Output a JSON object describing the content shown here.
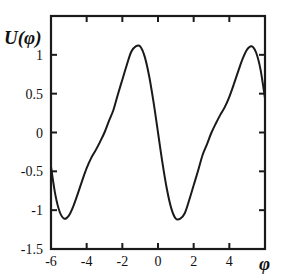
{
  "chart_data": {
    "type": "line",
    "title": "",
    "xlabel": "φ",
    "ylabel": "U(φ)",
    "xlim": [
      -6,
      6
    ],
    "ylim": [
      -1.5,
      1.5
    ],
    "grid": false,
    "legend": null,
    "x_ticks": [
      -6,
      -4,
      -2,
      0,
      2,
      4
    ],
    "x_tick_labels": [
      "-6",
      "-4",
      "-2",
      "0",
      "2",
      "4"
    ],
    "y_ticks": [
      -1.5,
      -1,
      -0.5,
      0,
      0.5,
      1
    ],
    "y_tick_labels": [
      "-1.5",
      "-1",
      "-0.5",
      "0",
      "0.5",
      "1"
    ],
    "series": [
      {
        "name": "U(φ)",
        "color": "#1a1a1a",
        "x": [
          -6.0,
          -5.75,
          -5.5,
          -5.25,
          -5.0,
          -4.75,
          -4.5,
          -4.25,
          -4.0,
          -3.75,
          -3.5,
          -3.25,
          -3.0,
          -2.75,
          -2.5,
          -2.25,
          -2.0,
          -1.75,
          -1.5,
          -1.25,
          -1.0,
          -0.75,
          -0.5,
          -0.25,
          0.0,
          0.25,
          0.5,
          0.75,
          1.0,
          1.25,
          1.5,
          1.75,
          2.0,
          2.25,
          2.5,
          2.75,
          3.0,
          3.25,
          3.5,
          3.75,
          4.0,
          4.25,
          4.5,
          4.75,
          5.0,
          5.25,
          5.5,
          5.75,
          6.0
        ],
        "y": [
          -0.44,
          -0.81,
          -1.03,
          -1.11,
          -1.07,
          -0.95,
          -0.79,
          -0.62,
          -0.46,
          -0.33,
          -0.23,
          -0.12,
          0.0,
          0.15,
          0.29,
          0.49,
          0.68,
          0.87,
          1.04,
          1.11,
          1.11,
          0.98,
          0.73,
          0.39,
          0.0,
          -0.39,
          -0.73,
          -0.98,
          -1.11,
          -1.11,
          -1.04,
          -0.87,
          -0.68,
          -0.49,
          -0.29,
          -0.15,
          0.0,
          0.12,
          0.23,
          0.33,
          0.46,
          0.62,
          0.79,
          0.95,
          1.07,
          1.11,
          1.03,
          0.81,
          0.44
        ]
      }
    ]
  }
}
